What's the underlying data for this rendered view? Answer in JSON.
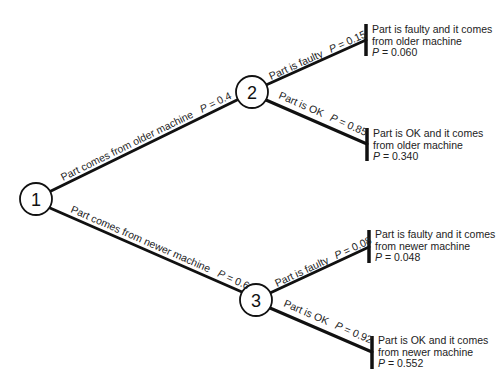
{
  "diagram": {
    "type": "probability-tree",
    "nodes": [
      {
        "id": "1",
        "label": "1"
      },
      {
        "id": "2",
        "label": "2"
      },
      {
        "id": "3",
        "label": "3"
      }
    ],
    "branches": {
      "older": {
        "text": "Part comes from older machine",
        "p_sym": "P",
        "p_val": " = 0.4"
      },
      "newer": {
        "text": "Part comes from newer machine",
        "p_sym": "P",
        "p_val": " = 0.6"
      },
      "older_faulty": {
        "text": "Part is faulty",
        "p_sym": "P",
        "p_val": " = 0.15"
      },
      "older_ok": {
        "text": "Part is OK",
        "p_sym": "P",
        "p_val": " = 0.85"
      },
      "newer_faulty": {
        "text": "Part is faulty",
        "p_sym": "P",
        "p_val": " = 0.08"
      },
      "newer_ok": {
        "text": "Part is OK",
        "p_sym": "P",
        "p_val": " = 0.92"
      }
    },
    "outcomes": [
      {
        "line1": "Part is faulty and it comes",
        "line2": "from older machine",
        "p_sym": "P",
        "p_val": " = 0.060"
      },
      {
        "line1": "Part is OK and it comes",
        "line2": "from older machine",
        "p_sym": "P",
        "p_val": " = 0.340"
      },
      {
        "line1": "Part is faulty and it comes",
        "line2": "from newer machine",
        "p_sym": "P",
        "p_val": " = 0.048"
      },
      {
        "line1": "Part is OK and it comes",
        "line2": "from newer machine",
        "p_sym": "P",
        "p_val": " = 0.552"
      }
    ]
  }
}
